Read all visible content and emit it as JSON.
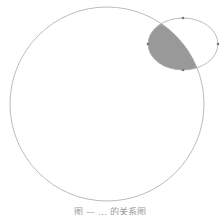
{
  "diagram": {
    "circle": {
      "cx": 107,
      "cy": 104,
      "r": 97,
      "stroke": "#aaaaaa"
    },
    "ellipse": {
      "cx": 183,
      "cy": 44,
      "rx": 35,
      "ry": 26,
      "stroke": "#aaaaaa"
    },
    "intersection_fill": "#999999",
    "vertex_points": [
      {
        "x": 183,
        "y": 18
      },
      {
        "x": 148,
        "y": 44
      },
      {
        "x": 218,
        "y": 44
      },
      {
        "x": 183,
        "y": 70
      }
    ]
  },
  "caption": "图 — … 的关系图"
}
